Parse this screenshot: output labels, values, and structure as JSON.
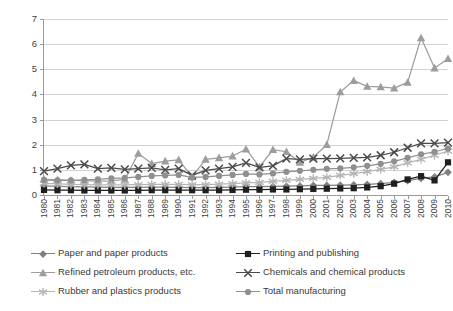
{
  "chart_data": {
    "type": "line",
    "title": "",
    "subtitle": "",
    "xlabel": "",
    "ylabel": "",
    "xlim": [
      1980,
      2010
    ],
    "ylim": [
      0,
      7
    ],
    "yticks": [
      0,
      1,
      2,
      3,
      4,
      5,
      6,
      7
    ],
    "grid": "horizontal",
    "legend_position": "bottom",
    "legend_columns": 2,
    "x": [
      1980,
      1981,
      1982,
      1983,
      1984,
      1985,
      1986,
      1987,
      1988,
      1989,
      1990,
      1991,
      1992,
      1993,
      1994,
      1995,
      1996,
      1997,
      1998,
      1999,
      2000,
      2001,
      2002,
      2003,
      2004,
      2005,
      2006,
      2007,
      2008,
      2009,
      2010
    ],
    "categories": [
      "1980",
      "1981",
      "1982",
      "1983",
      "1984",
      "1985",
      "1986",
      "1987",
      "1988",
      "1989",
      "1990",
      "1991",
      "1992",
      "1993",
      "1994",
      "1995",
      "1996",
      "1997",
      "1998",
      "1999",
      "2000",
      "2001",
      "2002",
      "2003",
      "2004",
      "2005",
      "2006",
      "2007",
      "2008",
      "2009",
      "2010"
    ],
    "series": [
      {
        "name": "Paper and paper products",
        "marker": "diamond",
        "color": "#808080",
        "values": [
          0.36,
          0.34,
          0.33,
          0.32,
          0.31,
          0.3,
          0.3,
          0.3,
          0.31,
          0.31,
          0.3,
          0.29,
          0.29,
          0.3,
          0.31,
          0.33,
          0.33,
          0.34,
          0.35,
          0.36,
          0.38,
          0.38,
          0.39,
          0.4,
          0.42,
          0.45,
          0.5,
          0.57,
          0.66,
          0.72,
          0.9
        ]
      },
      {
        "name": "Printing and publishing",
        "marker": "square",
        "color": "#1f1f1f",
        "values": [
          0.2,
          0.19,
          0.19,
          0.18,
          0.18,
          0.18,
          0.18,
          0.18,
          0.19,
          0.19,
          0.19,
          0.19,
          0.19,
          0.19,
          0.2,
          0.21,
          0.21,
          0.22,
          0.22,
          0.23,
          0.24,
          0.25,
          0.26,
          0.27,
          0.3,
          0.35,
          0.45,
          0.62,
          0.75,
          0.58,
          1.3
        ]
      },
      {
        "name": "Refined petroleum products, etc.",
        "marker": "triangle",
        "color": "#9d9d9d",
        "values": [
          0.62,
          0.6,
          0.58,
          0.57,
          0.55,
          0.56,
          0.62,
          1.65,
          1.25,
          1.35,
          1.4,
          0.72,
          1.42,
          1.48,
          1.55,
          1.82,
          1.12,
          1.8,
          1.72,
          1.3,
          1.5,
          2.0,
          4.1,
          4.55,
          4.32,
          4.3,
          4.25,
          4.48,
          6.25,
          5.05,
          5.42
        ]
      },
      {
        "name": "Chemicals and chemical products",
        "marker": "cross",
        "color": "#4a4a4a",
        "values": [
          0.95,
          1.05,
          1.18,
          1.22,
          1.05,
          1.08,
          1.02,
          1.05,
          1.08,
          1.0,
          1.05,
          0.78,
          0.98,
          1.05,
          1.12,
          1.28,
          1.1,
          1.16,
          1.45,
          1.42,
          1.45,
          1.45,
          1.46,
          1.48,
          1.5,
          1.58,
          1.7,
          1.88,
          2.05,
          2.05,
          2.08
        ]
      },
      {
        "name": "Rubber and plastics products",
        "marker": "star",
        "color": "#b5b5b5",
        "values": [
          0.46,
          0.44,
          0.42,
          0.41,
          0.4,
          0.4,
          0.4,
          0.41,
          0.42,
          0.42,
          0.42,
          0.41,
          0.41,
          0.43,
          0.45,
          0.48,
          0.5,
          0.54,
          0.58,
          0.62,
          0.66,
          0.7,
          0.78,
          0.85,
          0.93,
          1.02,
          1.12,
          1.28,
          1.42,
          1.58,
          1.75
        ]
      },
      {
        "name": "Total manufacturing",
        "marker": "circle",
        "color": "#8f8f8f",
        "values": [
          0.6,
          0.58,
          0.58,
          0.6,
          0.62,
          0.66,
          0.68,
          0.72,
          0.76,
          0.78,
          0.8,
          0.7,
          0.72,
          0.76,
          0.8,
          0.84,
          0.82,
          0.86,
          0.92,
          0.96,
          1.0,
          1.04,
          1.06,
          1.1,
          1.16,
          1.24,
          1.34,
          1.48,
          1.62,
          1.72,
          1.85
        ]
      }
    ]
  },
  "legend": {
    "items": [
      {
        "label": "Paper and paper products",
        "marker": "diamond",
        "color": "#808080"
      },
      {
        "label": "Printing and publishing",
        "marker": "square",
        "color": "#1f1f1f"
      },
      {
        "label": "Refined petroleum products, etc.",
        "marker": "triangle",
        "color": "#9d9d9d"
      },
      {
        "label": "Chemicals and chemical products",
        "marker": "cross",
        "color": "#4a4a4a"
      },
      {
        "label": "Rubber and plastics products",
        "marker": "star",
        "color": "#b5b5b5"
      },
      {
        "label": "Total manufacturing",
        "marker": "circle",
        "color": "#8f8f8f"
      }
    ]
  }
}
